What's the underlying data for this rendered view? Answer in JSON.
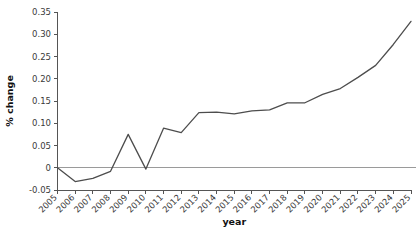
{
  "chart_data": {
    "type": "line",
    "title": "",
    "subtitle": "",
    "xlabel": "year",
    "ylabel": "% change",
    "x": [
      2005,
      2006,
      2007,
      2008,
      2009,
      2010,
      2011,
      2012,
      2013,
      2014,
      2015,
      2016,
      2017,
      2018,
      2019,
      2020,
      2021,
      2022,
      2023,
      2024,
      2025
    ],
    "categories": [
      "2005",
      "2006",
      "2007",
      "2008",
      "2009",
      "2010",
      "2011",
      "2012",
      "2013",
      "2014",
      "2015",
      "2016",
      "2017",
      "2018",
      "2019",
      "2020",
      "2021",
      "2022",
      "2023",
      "2024",
      "2025"
    ],
    "values": [
      0.0,
      -0.031,
      -0.024,
      -0.008,
      0.075,
      -0.003,
      0.089,
      0.079,
      0.124,
      0.125,
      0.121,
      0.128,
      0.13,
      0.146,
      0.146,
      0.165,
      0.178,
      0.203,
      0.23,
      0.277,
      0.329
    ],
    "series": [
      {
        "name": "% change",
        "values": [
          0.0,
          -0.031,
          -0.024,
          -0.008,
          0.075,
          -0.003,
          0.089,
          0.079,
          0.124,
          0.125,
          0.121,
          0.128,
          0.13,
          0.146,
          0.146,
          0.165,
          0.178,
          0.203,
          0.23,
          0.277,
          0.329
        ],
        "color": "#4d4d4d"
      }
    ],
    "xlim": [
      2005,
      2025
    ],
    "ylim": [
      -0.05,
      0.35
    ],
    "ytick_labels": [
      "0.35",
      "0.30",
      "0.25",
      "0.20",
      "0.15",
      "0.10",
      "0.05",
      "0",
      "-0.05"
    ],
    "ytick_values": [
      0.35,
      0.3,
      0.25,
      0.2,
      0.15,
      0.1,
      0.05,
      0,
      -0.05
    ],
    "xtick_labels": [
      "2005",
      "2006",
      "2007",
      "2008",
      "2009",
      "2010",
      "2011",
      "2012",
      "2013",
      "2014",
      "2015",
      "2016",
      "2017",
      "2018",
      "2019",
      "2020",
      "2021",
      "2022",
      "2023",
      "2024",
      "2025"
    ],
    "grid": false,
    "legend": "none",
    "reference_line": 0,
    "xtick_label_rotation": -45,
    "colors": {
      "line": "#4d4d4d",
      "axis": "#555555",
      "reference_line": "#9a9a9a",
      "tick_text": "#3a3a3a",
      "axis_title": "#111111",
      "background": "#ffffff"
    }
  }
}
